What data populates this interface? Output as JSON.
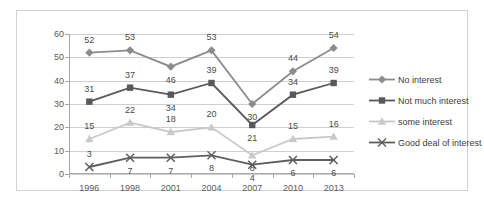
{
  "chart_data": {
    "type": "line",
    "title": "",
    "subtitle": "",
    "xlabel": "",
    "ylabel": "",
    "categories": [
      "1996",
      "1998",
      "2001",
      "2004",
      "2007",
      "2010",
      "2013"
    ],
    "ylim": [
      0,
      60
    ],
    "yticks": [
      0,
      10,
      20,
      30,
      40,
      50,
      60
    ],
    "grid": true,
    "legend_position": "right",
    "series": [
      {
        "name": "No interest",
        "color": "#8c8c8c",
        "marker": "diamond",
        "values": [
          52,
          53,
          46,
          53,
          30,
          44,
          54
        ],
        "label_offsets": [
          -13,
          -13,
          13,
          -13,
          13,
          -13,
          -13
        ]
      },
      {
        "name": "Not much interest",
        "color": "#595959",
        "marker": "square",
        "values": [
          31,
          37,
          34,
          39,
          21,
          34,
          39
        ],
        "label_offsets": [
          -13,
          -13,
          13,
          -13,
          13,
          -13,
          -13
        ]
      },
      {
        "name": "some interest",
        "color": "#c9c9c9",
        "marker": "triangle",
        "values": [
          15,
          22,
          18,
          20,
          8,
          15,
          16
        ],
        "label_offsets": [
          -13,
          -13,
          -13,
          -13,
          13,
          -13,
          -13
        ]
      },
      {
        "name": "Good deal of interest",
        "color": "#5e5e5e",
        "marker": "x",
        "values": [
          3,
          7,
          7,
          8,
          4,
          6,
          6
        ],
        "label_offsets": [
          -13,
          13,
          13,
          13,
          13,
          13,
          13
        ]
      }
    ]
  },
  "legend": {
    "items": [
      {
        "label": "No interest"
      },
      {
        "label": "Not much interest"
      },
      {
        "label": "some interest"
      },
      {
        "label": "Good deal of interest"
      }
    ]
  }
}
